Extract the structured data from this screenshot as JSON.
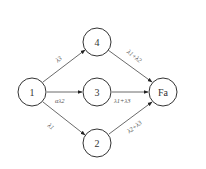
{
  "diagram": {
    "type": "state-transition-graph",
    "nodes": [
      {
        "id": "1",
        "label": "1",
        "cx": 32,
        "cy": 92
      },
      {
        "id": "4",
        "label": "4",
        "cx": 97,
        "cy": 42
      },
      {
        "id": "3",
        "label": "3",
        "cx": 97,
        "cy": 92
      },
      {
        "id": "2",
        "label": "2",
        "cx": 97,
        "cy": 143
      },
      {
        "id": "Fa",
        "label": "Fa",
        "cx": 163,
        "cy": 92
      }
    ],
    "node_radius": 14,
    "edges": [
      {
        "from": "1",
        "to": "4",
        "label": "λ3"
      },
      {
        "from": "1",
        "to": "3",
        "label": "αλ2"
      },
      {
        "from": "1",
        "to": "2",
        "label": "λ1"
      },
      {
        "from": "4",
        "to": "Fa",
        "label": "λ1+λ2"
      },
      {
        "from": "3",
        "to": "Fa",
        "label": "λ1+λ3"
      },
      {
        "from": "2",
        "to": "Fa",
        "label": "λ2+λ3"
      }
    ],
    "colors": {
      "stroke": "#333333",
      "background": "#ffffff"
    }
  }
}
